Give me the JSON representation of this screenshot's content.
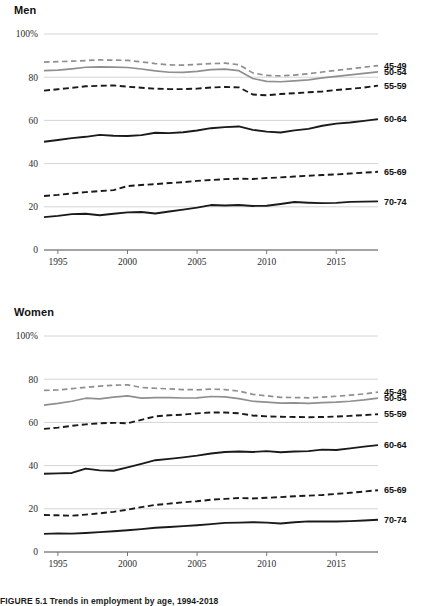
{
  "figure": {
    "caption": "FIGURE 5.1  Trends in employment by age, 1994-2018"
  },
  "panels": [
    {
      "id": "men",
      "title": "Men"
    },
    {
      "id": "women",
      "title": "Women"
    }
  ],
  "axis": {
    "y_ticks": [
      "100%",
      "80",
      "60",
      "40",
      "20",
      "0"
    ],
    "y_values": [
      100,
      80,
      60,
      40,
      20,
      0
    ],
    "x_ticks": [
      "1995",
      "2000",
      "2005",
      "2010",
      "2015"
    ],
    "x_values": [
      1995,
      2000,
      2005,
      2010,
      2015
    ]
  },
  "legend": {
    "labels": [
      "45-49",
      "50-54",
      "55-59",
      "60-64",
      "65-69",
      "70-74"
    ]
  },
  "colors": {
    "gray_series": "#8f8f8f",
    "black_series": "#1a1a1a",
    "gridline": "#c9c9c9",
    "axis": "#4a4a4a",
    "text": "#1a1a1a"
  },
  "chart_data": [
    {
      "type": "line",
      "title": "Men",
      "xlabel": "",
      "ylabel": "",
      "xlim": [
        1994,
        2018
      ],
      "ylim": [
        0,
        100
      ],
      "grid": true,
      "legend_position": "right-inline",
      "x": [
        1994,
        1995,
        1996,
        1997,
        1998,
        1999,
        2000,
        2001,
        2002,
        2003,
        2004,
        2005,
        2006,
        2007,
        2008,
        2009,
        2010,
        2011,
        2012,
        2013,
        2014,
        2015,
        2016,
        2017,
        2018
      ],
      "series": [
        {
          "name": "45-49",
          "style": "dashed",
          "color": "#8f8f8f",
          "values": [
            87.0,
            87.2,
            87.4,
            87.7,
            88.0,
            87.9,
            87.8,
            87.1,
            86.3,
            85.7,
            85.6,
            85.9,
            86.3,
            86.5,
            85.8,
            82.0,
            80.8,
            80.6,
            81.0,
            81.6,
            82.4,
            83.2,
            83.9,
            84.6,
            85.4
          ]
        },
        {
          "name": "50-54",
          "style": "solid",
          "color": "#8f8f8f",
          "values": [
            83.0,
            83.3,
            83.9,
            84.6,
            84.8,
            84.7,
            84.5,
            83.8,
            82.9,
            82.3,
            82.2,
            82.7,
            83.5,
            83.7,
            83.0,
            79.4,
            78.1,
            77.9,
            78.3,
            78.8,
            79.7,
            80.4,
            81.1,
            81.8,
            82.5
          ]
        },
        {
          "name": "55-59",
          "style": "dashed",
          "color": "#1a1a1a",
          "values": [
            73.8,
            74.4,
            75.1,
            75.8,
            76.0,
            76.2,
            75.6,
            75.1,
            74.7,
            74.5,
            74.5,
            74.7,
            75.2,
            75.5,
            75.3,
            72.0,
            71.6,
            72.2,
            72.6,
            73.0,
            73.4,
            74.1,
            74.6,
            75.2,
            76.1
          ]
        },
        {
          "name": "60-64",
          "style": "solid",
          "color": "#1a1a1a",
          "values": [
            50.1,
            50.9,
            51.8,
            52.4,
            53.3,
            52.9,
            52.8,
            53.2,
            54.3,
            54.1,
            54.5,
            55.3,
            56.4,
            56.9,
            57.2,
            55.6,
            54.8,
            54.4,
            55.4,
            56.1,
            57.5,
            58.5,
            59.0,
            59.8,
            60.6
          ]
        },
        {
          "name": "65-69",
          "style": "dashed",
          "color": "#1a1a1a",
          "values": [
            25.0,
            25.5,
            26.2,
            26.8,
            27.3,
            27.7,
            29.6,
            30.1,
            30.5,
            31.0,
            31.4,
            32.0,
            32.4,
            32.8,
            33.0,
            32.9,
            33.3,
            33.6,
            34.0,
            34.4,
            34.7,
            35.0,
            35.4,
            35.8,
            36.2
          ]
        },
        {
          "name": "70-74",
          "style": "solid",
          "color": "#1a1a1a",
          "values": [
            15.2,
            15.8,
            16.6,
            16.8,
            16.1,
            16.8,
            17.4,
            17.6,
            16.9,
            17.8,
            18.7,
            19.6,
            20.8,
            20.6,
            20.8,
            20.4,
            20.5,
            21.3,
            22.2,
            21.9,
            21.7,
            21.8,
            22.3,
            22.4,
            22.5
          ]
        }
      ]
    },
    {
      "type": "line",
      "title": "Women",
      "xlabel": "",
      "ylabel": "",
      "xlim": [
        1994,
        2018
      ],
      "ylim": [
        0,
        100
      ],
      "grid": true,
      "legend_position": "right-inline",
      "x": [
        1994,
        1995,
        1996,
        1997,
        1998,
        1999,
        2000,
        2001,
        2002,
        2003,
        2004,
        2005,
        2006,
        2007,
        2008,
        2009,
        2010,
        2011,
        2012,
        2013,
        2014,
        2015,
        2016,
        2017,
        2018
      ],
      "series": [
        {
          "name": "45-49",
          "style": "dashed",
          "color": "#8f8f8f",
          "values": [
            74.8,
            75.0,
            75.6,
            76.2,
            76.8,
            77.2,
            77.4,
            76.2,
            75.8,
            75.5,
            75.2,
            75.1,
            75.4,
            75.2,
            74.5,
            73.0,
            72.3,
            71.6,
            71.5,
            71.4,
            71.7,
            72.1,
            72.6,
            73.2,
            74.0
          ]
        },
        {
          "name": "50-54",
          "style": "solid",
          "color": "#8f8f8f",
          "values": [
            68.0,
            68.8,
            69.8,
            71.2,
            70.9,
            71.7,
            72.3,
            71.2,
            71.5,
            71.5,
            71.3,
            71.4,
            72.0,
            71.8,
            71.0,
            69.8,
            69.4,
            68.9,
            69.0,
            68.8,
            69.2,
            69.4,
            69.8,
            70.4,
            71.2
          ]
        },
        {
          "name": "55-59",
          "style": "dashed",
          "color": "#1a1a1a",
          "values": [
            57.0,
            57.6,
            58.4,
            59.1,
            59.6,
            59.8,
            59.6,
            61.2,
            62.8,
            63.3,
            63.6,
            64.2,
            64.6,
            64.6,
            64.2,
            63.2,
            62.8,
            62.6,
            62.5,
            62.4,
            62.5,
            62.7,
            63.0,
            63.4,
            63.8
          ]
        },
        {
          "name": "60-64",
          "style": "solid",
          "color": "#1a1a1a",
          "values": [
            36.2,
            36.4,
            36.6,
            38.6,
            37.8,
            37.6,
            39.2,
            40.8,
            42.5,
            43.1,
            43.8,
            44.6,
            45.6,
            46.3,
            46.5,
            46.3,
            46.7,
            46.2,
            46.5,
            46.7,
            47.4,
            47.2,
            48.0,
            48.8,
            49.5
          ]
        },
        {
          "name": "65-69",
          "style": "dashed",
          "color": "#1a1a1a",
          "values": [
            17.1,
            17.0,
            16.8,
            17.3,
            17.9,
            18.6,
            19.6,
            20.8,
            21.8,
            22.4,
            23.0,
            23.5,
            24.2,
            24.6,
            25.0,
            24.8,
            25.1,
            25.4,
            25.8,
            26.1,
            26.4,
            26.9,
            27.4,
            28.0,
            28.6
          ]
        },
        {
          "name": "70-74",
          "style": "solid",
          "color": "#1a1a1a",
          "values": [
            8.4,
            8.6,
            8.5,
            8.8,
            9.2,
            9.6,
            10.1,
            10.6,
            11.2,
            11.6,
            12.0,
            12.4,
            12.9,
            13.5,
            13.6,
            13.8,
            13.6,
            13.2,
            13.8,
            14.2,
            14.1,
            14.1,
            14.3,
            14.6,
            14.9
          ]
        }
      ]
    }
  ]
}
